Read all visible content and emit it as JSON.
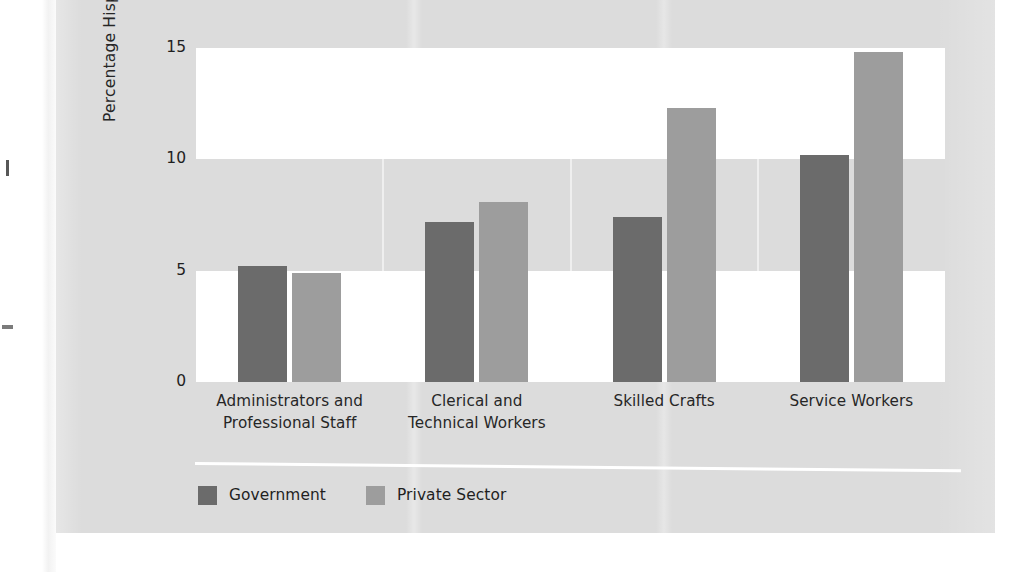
{
  "chart_data": {
    "type": "bar",
    "title": "",
    "xlabel": "",
    "ylabel": "Percentage Hispanic",
    "ylim": [
      0,
      15
    ],
    "yticks": [
      "0",
      "5",
      "10",
      "15"
    ],
    "ytick_values": [
      0,
      5,
      10,
      15
    ],
    "grid": false,
    "legend_position": "bottom-left",
    "categories": [
      "Administrators and\nProfessional Staff",
      "Clerical and\nTechnical Workers",
      "Skilled Crafts",
      "Service Workers"
    ],
    "category_lines": [
      [
        "Administrators and",
        "Professional Staff"
      ],
      [
        "Clerical and",
        "Technical Workers"
      ],
      [
        "Skilled Crafts",
        ""
      ],
      [
        "Service Workers",
        ""
      ]
    ],
    "series": [
      {
        "name": "Government",
        "color": "#6b6b6b",
        "values": [
          5.2,
          7.2,
          7.4,
          10.2
        ]
      },
      {
        "name": "Private Sector",
        "color": "#9d9d9d",
        "values": [
          4.9,
          8.1,
          12.3,
          14.8
        ]
      }
    ],
    "background_bands": [
      {
        "range": [
          0,
          5
        ],
        "color": "#ffffff"
      },
      {
        "range": [
          5,
          10
        ],
        "color": "#dcdcdc"
      },
      {
        "range": [
          10,
          15
        ],
        "color": "#ffffff"
      }
    ],
    "panel_color": "#dcdcdc"
  },
  "legend": {
    "items": [
      {
        "label": "Government",
        "color": "#6b6b6b"
      },
      {
        "label": "Private Sector",
        "color": "#9d9d9d"
      }
    ]
  }
}
